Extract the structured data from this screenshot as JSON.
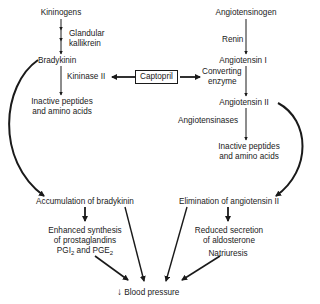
{
  "left_pathway": {
    "kininogens": "Kininogens",
    "glandular_kallikrein_1": "Glandular",
    "glandular_kallikrein_2": "kallikrein",
    "bradykinin": "Bradykinin",
    "kininase_ii": "Kininase II",
    "inactive_1": "Inactive peptides",
    "inactive_2": "and amino acids"
  },
  "right_pathway": {
    "angiotensinogen": "Angiotensinogen",
    "renin": "Renin",
    "angiotensin_i": "Angiotensin I",
    "converting_1": "Converting",
    "converting_2": "enzyme",
    "angiotensin_ii": "Angiotensin II",
    "angiotensinases": "Angiotensinases",
    "inactive_1": "Inactive peptides",
    "inactive_2": "and amino acids"
  },
  "inhibitor": {
    "label": "Captopril"
  },
  "effects": {
    "accumulation": "Accumulation of bradykinin",
    "enhanced_1": "Enhanced synthesis",
    "enhanced_2": "of prostaglandins",
    "pgi": "PGI",
    "sub2a": "2",
    "and": " and PGE",
    "sub2b": "2",
    "elimination": "Elimination of angiotensin II",
    "reduced_1": "Reduced secretion",
    "reduced_2": "of aldosterone",
    "natriuresis": "Natriuresis"
  },
  "outcome": {
    "arrow_glyph": "↓",
    "label": "Blood pressure"
  }
}
